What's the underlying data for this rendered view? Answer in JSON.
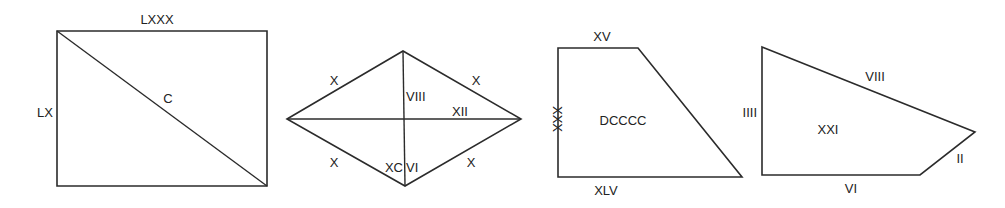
{
  "colors": {
    "stroke": "#2b2b2b",
    "text": "#222222",
    "background": "#ffffff"
  },
  "figures": [
    {
      "shape": "rectangle",
      "vertices": [
        [
          57,
          31
        ],
        [
          267,
          31
        ],
        [
          267,
          186
        ],
        [
          57,
          186
        ]
      ],
      "diagonal": [
        [
          57,
          31
        ],
        [
          267,
          186
        ]
      ],
      "labels": {
        "top": "LXXX",
        "left": "LX",
        "diagonal": "C"
      }
    },
    {
      "shape": "rhombus",
      "vertices": [
        [
          287,
          119
        ],
        [
          403,
          51
        ],
        [
          521,
          119
        ],
        [
          405,
          186
        ]
      ],
      "diagonals": [
        [
          [
            287,
            119
          ],
          [
            521,
            119
          ]
        ],
        [
          [
            403,
            51
          ],
          [
            405,
            186
          ]
        ]
      ],
      "labels": {
        "top_left_side": "X",
        "top_right_side": "X",
        "bottom_left_side": "X",
        "bottom_right_side": "X",
        "vertical_diagonal": "VIII",
        "horizontal_diagonal": "XII",
        "area_left": "XC",
        "area_right": "VI"
      }
    },
    {
      "shape": "trapezoid",
      "vertices": [
        [
          558,
          48
        ],
        [
          638,
          48
        ],
        [
          742,
          177
        ],
        [
          558,
          177
        ]
      ],
      "labels": {
        "top": "XV",
        "left": "XXX",
        "bottom": "XLV",
        "area": "DCCCC"
      }
    },
    {
      "shape": "quadrilateral",
      "vertices": [
        [
          762,
          47
        ],
        [
          975,
          132
        ],
        [
          920,
          175
        ],
        [
          762,
          175
        ]
      ],
      "labels": {
        "left": "IIII",
        "slanted_top": "VIII",
        "short_right": "II",
        "bottom": "VI",
        "area": "XXI"
      }
    }
  ]
}
